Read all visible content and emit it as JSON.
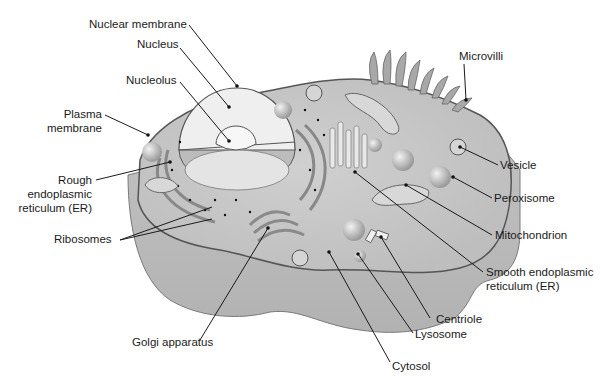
{
  "diagram": {
    "type": "labeled-illustration",
    "colors": {
      "background": "#ffffff",
      "cell_outer": "#bdbdbd",
      "cell_top": "#d6d6d6",
      "cytoplasm": "#c9c9c9",
      "nucleus": "#efefef",
      "membrane_line": "#555555",
      "label_text": "#1a1a1a",
      "ribosome_dot": "#222222"
    },
    "labels": {
      "nuclear_membrane": "Nuclear membrane",
      "nucleus": "Nucleus",
      "nucleolus": "Nucleolus",
      "plasma_membrane_1": "Plasma",
      "plasma_membrane_2": "membrane",
      "rough_er_1": "Rough",
      "rough_er_2": "endoplasmic",
      "rough_er_3": "reticulum (ER)",
      "ribosomes": "Ribosomes",
      "golgi": "Golgi apparatus",
      "microvilli": "Microvilli",
      "vesicle": "Vesicle",
      "peroxisome": "Peroxisome",
      "mitochondrion": "Mitochondrion",
      "smooth_er_1": "Smooth endoplasmic",
      "smooth_er_2": "reticulum (ER)",
      "centriole": "Centriole",
      "lysosome": "Lysosome",
      "cytosol": "Cytosol"
    }
  }
}
